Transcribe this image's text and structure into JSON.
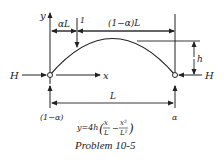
{
  "diagram": {
    "type": "three-hinged parabolic arch influence line problem",
    "labels": {
      "y_axis": "y",
      "x_axis": "x",
      "left_force": "H",
      "right_force": "H",
      "load": "1",
      "left_segment": "αL",
      "right_segment": "(1−α)L",
      "rise": "h",
      "span": "L",
      "left_reaction": "(1−α)",
      "right_reaction": "α"
    },
    "equation": {
      "prefix": "y=4h",
      "term1_num": "x",
      "term1_den": "L",
      "term2_num": "x²",
      "term2_den": "L²"
    },
    "caption": "Problem 10-5"
  }
}
